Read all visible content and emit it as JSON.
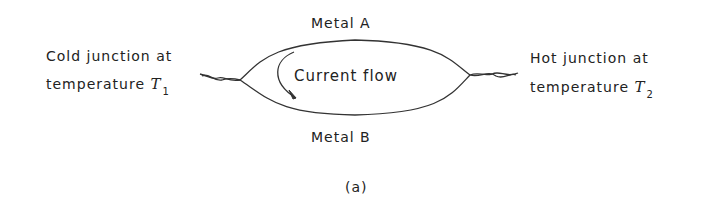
{
  "diagram": {
    "top_label": "Metal A",
    "bottom_label": "Metal B",
    "center_label": "Current flow",
    "left_label": {
      "line1": "Cold junction at",
      "line2_prefix": "temperature ",
      "var": "T",
      "sub": "1"
    },
    "right_label": {
      "line1": "Hot junction at",
      "line2_prefix": "temperature ",
      "var": "T",
      "sub": "2"
    },
    "caption": "(a)",
    "stroke_color": "#333333"
  }
}
